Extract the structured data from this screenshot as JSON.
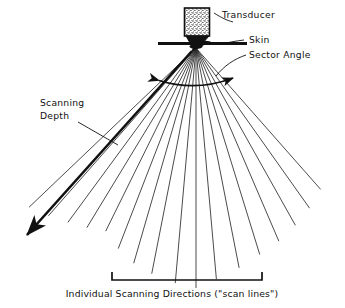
{
  "figure": {
    "background_color": "#ffffff",
    "ink_color": "#111111"
  },
  "labels": {
    "transducer": "Transducer",
    "skin": "Skin",
    "sector_angle": "Sector Angle",
    "scanning_depth_line1": "Scanning",
    "scanning_depth_line2": "Depth",
    "caption": "Individual Scanning Directions (\"scan lines\")"
  },
  "geometry": {
    "apex": {
      "x": 196,
      "y": 46
    },
    "transducer_body": {
      "x": 184,
      "y": 8,
      "width": 26,
      "height": 30
    },
    "skin_line": {
      "x1": 158,
      "y1": 43,
      "x2": 247,
      "y2": 43
    },
    "sector_arc": {
      "start_x": 156,
      "start_y": 80,
      "end_x": 236,
      "end_y": 78,
      "mid_y": 88
    },
    "depth_arrow": {
      "x1": 193,
      "y1": 50,
      "x2": 26,
      "y2": 236
    },
    "bracket": {
      "x1": 112,
      "x2": 262,
      "y": 280,
      "tick_height": 8
    },
    "fan_angle_left_deg": -48,
    "fan_angle_right_deg": 42
  },
  "chart_data": {
    "type": "scatter",
    "scan_lines": [
      {
        "index": 1,
        "angle_deg": -46,
        "length": 232
      },
      {
        "index": 2,
        "angle_deg": -41,
        "length": 225
      },
      {
        "index": 3,
        "angle_deg": -36,
        "length": 218
      },
      {
        "index": 4,
        "angle_deg": -31,
        "length": 212
      },
      {
        "index": 5,
        "angle_deg": -26,
        "length": 206
      },
      {
        "index": 6,
        "angle_deg": -21,
        "length": 217
      },
      {
        "index": 7,
        "angle_deg": -16,
        "length": 226
      },
      {
        "index": 8,
        "angle_deg": -11,
        "length": 232
      },
      {
        "index": 9,
        "angle_deg": -5,
        "length": 238
      },
      {
        "index": 10,
        "angle_deg": 0,
        "length": 242
      },
      {
        "index": 11,
        "angle_deg": 5,
        "length": 234
      },
      {
        "index": 12,
        "angle_deg": 11,
        "length": 226
      },
      {
        "index": 13,
        "angle_deg": 17,
        "length": 218
      },
      {
        "index": 14,
        "angle_deg": 23,
        "length": 212
      },
      {
        "index": 15,
        "angle_deg": 29,
        "length": 205
      },
      {
        "index": 16,
        "angle_deg": 35,
        "length": 198
      },
      {
        "index": 17,
        "angle_deg": 41,
        "length": 190
      }
    ],
    "count": 17,
    "apex_x": 196,
    "apex_y": 46
  }
}
